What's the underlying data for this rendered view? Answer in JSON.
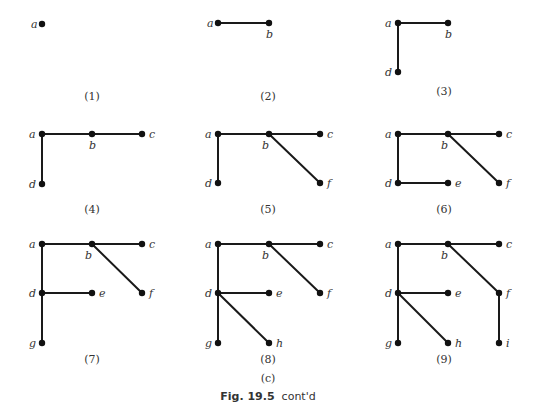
{
  "figure": {
    "title_bold": "Fig. 19.5",
    "title_rest": "cont'd",
    "part_label": "(c)",
    "colors": {
      "edge": "#1a1a1a",
      "node": "#111111",
      "text": "#333333"
    }
  },
  "panels": [
    {
      "caption": "(1)",
      "caption_pos": [
        92,
        100
      ],
      "nodes": [
        {
          "id": "a",
          "x": 42,
          "y": 24,
          "label_pos": [
            31,
            28
          ]
        }
      ],
      "edges": []
    },
    {
      "caption": "(2)",
      "caption_pos": [
        268,
        100
      ],
      "nodes": [
        {
          "id": "a",
          "x": 218,
          "y": 23,
          "label_pos": [
            207,
            27
          ]
        },
        {
          "id": "b",
          "x": 269,
          "y": 23,
          "label_pos": [
            266,
            38
          ]
        }
      ],
      "edges": [
        [
          "a",
          "b"
        ]
      ]
    },
    {
      "caption": "(3)",
      "caption_pos": [
        444,
        95
      ],
      "nodes": [
        {
          "id": "a",
          "x": 398,
          "y": 23,
          "label_pos": [
            385,
            27
          ]
        },
        {
          "id": "b",
          "x": 448,
          "y": 23,
          "label_pos": [
            445,
            38
          ]
        },
        {
          "id": "d",
          "x": 398,
          "y": 72,
          "label_pos": [
            385,
            76
          ]
        }
      ],
      "edges": [
        [
          "a",
          "b"
        ],
        [
          "a",
          "d"
        ]
      ]
    },
    {
      "caption": "(4)",
      "caption_pos": [
        92,
        213
      ],
      "nodes": [
        {
          "id": "a",
          "x": 42,
          "y": 134,
          "label_pos": [
            29,
            138
          ]
        },
        {
          "id": "b",
          "x": 92,
          "y": 134,
          "label_pos": [
            89,
            149
          ]
        },
        {
          "id": "c",
          "x": 142,
          "y": 134,
          "label_pos": [
            149,
            138
          ]
        },
        {
          "id": "d",
          "x": 42,
          "y": 184,
          "label_pos": [
            29,
            188
          ]
        }
      ],
      "edges": [
        [
          "a",
          "b"
        ],
        [
          "b",
          "c"
        ],
        [
          "a",
          "d"
        ]
      ]
    },
    {
      "caption": "(5)",
      "caption_pos": [
        268,
        213
      ],
      "nodes": [
        {
          "id": "a",
          "x": 218,
          "y": 134,
          "label_pos": [
            205,
            138
          ]
        },
        {
          "id": "b",
          "x": 269,
          "y": 134,
          "label_pos": [
            262,
            149
          ]
        },
        {
          "id": "c",
          "x": 320,
          "y": 134,
          "label_pos": [
            327,
            138
          ]
        },
        {
          "id": "d",
          "x": 218,
          "y": 183,
          "label_pos": [
            205,
            187
          ]
        },
        {
          "id": "f",
          "x": 320,
          "y": 183,
          "label_pos": [
            327,
            187
          ]
        }
      ],
      "edges": [
        [
          "a",
          "b"
        ],
        [
          "b",
          "c"
        ],
        [
          "a",
          "d"
        ],
        [
          "b",
          "f"
        ]
      ]
    },
    {
      "caption": "(6)",
      "caption_pos": [
        444,
        213
      ],
      "nodes": [
        {
          "id": "a",
          "x": 398,
          "y": 134,
          "label_pos": [
            385,
            138
          ]
        },
        {
          "id": "b",
          "x": 448,
          "y": 134,
          "label_pos": [
            441,
            149
          ]
        },
        {
          "id": "c",
          "x": 499,
          "y": 134,
          "label_pos": [
            506,
            138
          ]
        },
        {
          "id": "d",
          "x": 398,
          "y": 183,
          "label_pos": [
            385,
            187
          ]
        },
        {
          "id": "e",
          "x": 448,
          "y": 183,
          "label_pos": [
            455,
            187
          ]
        },
        {
          "id": "f",
          "x": 499,
          "y": 183,
          "label_pos": [
            506,
            187
          ]
        }
      ],
      "edges": [
        [
          "a",
          "b"
        ],
        [
          "b",
          "c"
        ],
        [
          "a",
          "d"
        ],
        [
          "b",
          "f"
        ],
        [
          "d",
          "e"
        ]
      ]
    },
    {
      "caption": "(7)",
      "caption_pos": [
        92,
        363
      ],
      "nodes": [
        {
          "id": "a",
          "x": 42,
          "y": 244,
          "label_pos": [
            29,
            248
          ]
        },
        {
          "id": "b",
          "x": 92,
          "y": 244,
          "label_pos": [
            85,
            259
          ]
        },
        {
          "id": "c",
          "x": 142,
          "y": 244,
          "label_pos": [
            149,
            248
          ]
        },
        {
          "id": "d",
          "x": 42,
          "y": 293,
          "label_pos": [
            29,
            297
          ]
        },
        {
          "id": "e",
          "x": 92,
          "y": 293,
          "label_pos": [
            99,
            297
          ]
        },
        {
          "id": "f",
          "x": 142,
          "y": 293,
          "label_pos": [
            149,
            297
          ]
        },
        {
          "id": "g",
          "x": 42,
          "y": 343,
          "label_pos": [
            29,
            347
          ]
        }
      ],
      "edges": [
        [
          "a",
          "b"
        ],
        [
          "b",
          "c"
        ],
        [
          "a",
          "d"
        ],
        [
          "b",
          "f"
        ],
        [
          "d",
          "e"
        ],
        [
          "d",
          "g"
        ]
      ]
    },
    {
      "caption": "(8)",
      "caption_pos": [
        268,
        363
      ],
      "nodes": [
        {
          "id": "a",
          "x": 218,
          "y": 244,
          "label_pos": [
            205,
            248
          ]
        },
        {
          "id": "b",
          "x": 269,
          "y": 244,
          "label_pos": [
            262,
            259
          ]
        },
        {
          "id": "c",
          "x": 320,
          "y": 244,
          "label_pos": [
            327,
            248
          ]
        },
        {
          "id": "d",
          "x": 218,
          "y": 293,
          "label_pos": [
            205,
            297
          ]
        },
        {
          "id": "e",
          "x": 269,
          "y": 293,
          "label_pos": [
            276,
            297
          ]
        },
        {
          "id": "f",
          "x": 320,
          "y": 293,
          "label_pos": [
            327,
            297
          ]
        },
        {
          "id": "g",
          "x": 218,
          "y": 343,
          "label_pos": [
            205,
            347
          ]
        },
        {
          "id": "h",
          "x": 269,
          "y": 343,
          "label_pos": [
            276,
            347
          ]
        }
      ],
      "edges": [
        [
          "a",
          "b"
        ],
        [
          "b",
          "c"
        ],
        [
          "a",
          "d"
        ],
        [
          "b",
          "f"
        ],
        [
          "d",
          "e"
        ],
        [
          "d",
          "g"
        ],
        [
          "d",
          "h"
        ]
      ]
    },
    {
      "caption": "(9)",
      "caption_pos": [
        444,
        363
      ],
      "nodes": [
        {
          "id": "a",
          "x": 398,
          "y": 244,
          "label_pos": [
            385,
            248
          ]
        },
        {
          "id": "b",
          "x": 448,
          "y": 244,
          "label_pos": [
            441,
            259
          ]
        },
        {
          "id": "c",
          "x": 499,
          "y": 244,
          "label_pos": [
            506,
            248
          ]
        },
        {
          "id": "d",
          "x": 398,
          "y": 293,
          "label_pos": [
            385,
            297
          ]
        },
        {
          "id": "e",
          "x": 448,
          "y": 293,
          "label_pos": [
            455,
            297
          ]
        },
        {
          "id": "f",
          "x": 499,
          "y": 293,
          "label_pos": [
            506,
            297
          ]
        },
        {
          "id": "g",
          "x": 398,
          "y": 343,
          "label_pos": [
            385,
            347
          ]
        },
        {
          "id": "h",
          "x": 448,
          "y": 343,
          "label_pos": [
            455,
            347
          ]
        },
        {
          "id": "i",
          "x": 499,
          "y": 343,
          "label_pos": [
            506,
            347
          ]
        }
      ],
      "edges": [
        [
          "a",
          "b"
        ],
        [
          "b",
          "c"
        ],
        [
          "a",
          "d"
        ],
        [
          "b",
          "f"
        ],
        [
          "d",
          "e"
        ],
        [
          "d",
          "g"
        ],
        [
          "d",
          "h"
        ],
        [
          "f",
          "i"
        ]
      ]
    }
  ]
}
